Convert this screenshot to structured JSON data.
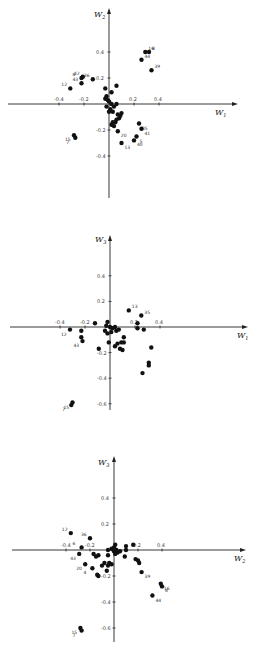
{
  "chart_data": [
    {
      "type": "scatter",
      "title": "",
      "xlabel": "W1",
      "ylabel": "W2",
      "xlim": [
        -0.6,
        0.7
      ],
      "ylim": [
        -0.7,
        0.6
      ],
      "xticks": [
        -0.4,
        -0.2,
        0.2,
        0.4
      ],
      "yticks": [
        0.4,
        0.2,
        -0.2,
        -0.4
      ],
      "grid": false,
      "points": [
        {
          "x": 0.29,
          "y": 0.4,
          "label": "16"
        },
        {
          "x": 0.32,
          "y": 0.4,
          "label": "8"
        },
        {
          "x": 0.26,
          "y": 0.34,
          "label": "44"
        },
        {
          "x": 0.34,
          "y": 0.26,
          "label": "39"
        },
        {
          "x": -0.21,
          "y": 0.21,
          "label": "42"
        },
        {
          "x": -0.22,
          "y": 0.2,
          "label": "6"
        },
        {
          "x": -0.22,
          "y": 0.16,
          "label": "43"
        },
        {
          "x": -0.13,
          "y": 0.19,
          "label": "36"
        },
        {
          "x": -0.31,
          "y": 0.12,
          "label": "12"
        },
        {
          "x": -0.28,
          "y": -0.24,
          "label": "15"
        },
        {
          "x": -0.27,
          "y": -0.26,
          "label": "7"
        },
        {
          "x": 0.24,
          "y": -0.15,
          "label": "35"
        },
        {
          "x": 0.26,
          "y": -0.19,
          "label": "41"
        },
        {
          "x": 0.22,
          "y": -0.25,
          "label": "5"
        },
        {
          "x": 0.2,
          "y": -0.28,
          "label": "40"
        },
        {
          "x": 0.1,
          "y": -0.3,
          "label": "13"
        },
        {
          "x": 0.07,
          "y": -0.21,
          "label": "20"
        },
        {
          "x": 0.06,
          "y": 0.14,
          "label": ""
        },
        {
          "x": 0.02,
          "y": 0.09,
          "label": ""
        },
        {
          "x": -0.03,
          "y": 0.12,
          "label": ""
        },
        {
          "x": -0.02,
          "y": 0.06,
          "label": ""
        },
        {
          "x": -0.03,
          "y": 0.04,
          "label": ""
        },
        {
          "x": -0.01,
          "y": 0.03,
          "label": ""
        },
        {
          "x": 0.0,
          "y": 0.02,
          "label": ""
        },
        {
          "x": 0.02,
          "y": 0.0,
          "label": ""
        },
        {
          "x": -0.02,
          "y": -0.02,
          "label": ""
        },
        {
          "x": 0.01,
          "y": -0.04,
          "label": ""
        },
        {
          "x": 0.04,
          "y": -0.02,
          "label": ""
        },
        {
          "x": 0.06,
          "y": 0.0,
          "label": ""
        },
        {
          "x": 0.03,
          "y": -0.06,
          "label": ""
        },
        {
          "x": 0.07,
          "y": -0.08,
          "label": ""
        },
        {
          "x": 0.09,
          "y": -0.09,
          "label": ""
        },
        {
          "x": 0.08,
          "y": -0.11,
          "label": ""
        },
        {
          "x": 0.06,
          "y": -0.12,
          "label": ""
        },
        {
          "x": 0.05,
          "y": -0.14,
          "label": ""
        },
        {
          "x": 0.03,
          "y": -0.14,
          "label": ""
        },
        {
          "x": 0.04,
          "y": -0.17,
          "label": ""
        },
        {
          "x": 0.02,
          "y": -0.16,
          "label": ""
        },
        {
          "x": 0.1,
          "y": -0.07,
          "label": ""
        },
        {
          "x": 0.0,
          "y": -0.06,
          "label": ""
        }
      ]
    },
    {
      "type": "scatter",
      "title": "",
      "xlabel": "W1",
      "ylabel": "W3",
      "xlim": [
        -0.6,
        0.7
      ],
      "ylim": [
        -0.7,
        0.6
      ],
      "xticks": [
        -0.4,
        -0.2,
        0.2,
        0.4
      ],
      "yticks": [
        0.4,
        0.2,
        -0.2,
        -0.4,
        -0.6
      ],
      "grid": false,
      "points": [
        {
          "x": 0.15,
          "y": 0.13,
          "label": "13"
        },
        {
          "x": 0.25,
          "y": 0.09,
          "label": "35"
        },
        {
          "x": -0.32,
          "y": -0.02,
          "label": "12"
        },
        {
          "x": -0.22,
          "y": -0.11,
          "label": "43"
        },
        {
          "x": -0.3,
          "y": -0.59,
          "label": "15"
        },
        {
          "x": -0.31,
          "y": -0.61,
          "label": "7"
        },
        {
          "x": -0.23,
          "y": -0.03,
          "label": ""
        },
        {
          "x": -0.23,
          "y": -0.08,
          "label": ""
        },
        {
          "x": -0.12,
          "y": 0.03,
          "label": ""
        },
        {
          "x": -0.09,
          "y": -0.17,
          "label": ""
        },
        {
          "x": 0.22,
          "y": 0.03,
          "label": ""
        },
        {
          "x": 0.22,
          "y": -0.01,
          "label": ""
        },
        {
          "x": 0.27,
          "y": -0.02,
          "label": ""
        },
        {
          "x": 0.33,
          "y": -0.16,
          "label": ""
        },
        {
          "x": 0.31,
          "y": -0.28,
          "label": ""
        },
        {
          "x": 0.31,
          "y": -0.3,
          "label": ""
        },
        {
          "x": 0.26,
          "y": -0.36,
          "label": ""
        },
        {
          "x": -0.02,
          "y": 0.04,
          "label": ""
        },
        {
          "x": -0.03,
          "y": 0.01,
          "label": ""
        },
        {
          "x": 0.0,
          "y": 0.0,
          "label": ""
        },
        {
          "x": 0.02,
          "y": -0.01,
          "label": ""
        },
        {
          "x": 0.04,
          "y": 0.0,
          "label": ""
        },
        {
          "x": 0.05,
          "y": -0.03,
          "label": ""
        },
        {
          "x": 0.07,
          "y": -0.02,
          "label": ""
        },
        {
          "x": 0.01,
          "y": -0.04,
          "label": ""
        },
        {
          "x": -0.02,
          "y": -0.05,
          "label": ""
        },
        {
          "x": -0.04,
          "y": -0.03,
          "label": ""
        },
        {
          "x": -0.01,
          "y": -0.12,
          "label": ""
        },
        {
          "x": 0.04,
          "y": -0.15,
          "label": ""
        },
        {
          "x": 0.06,
          "y": -0.13,
          "label": ""
        },
        {
          "x": 0.08,
          "y": -0.17,
          "label": ""
        },
        {
          "x": 0.1,
          "y": -0.18,
          "label": ""
        },
        {
          "x": 0.09,
          "y": -0.12,
          "label": ""
        },
        {
          "x": 0.11,
          "y": -0.08,
          "label": ""
        },
        {
          "x": 0.11,
          "y": -0.12,
          "label": ""
        }
      ]
    },
    {
      "type": "scatter",
      "title": "",
      "xlabel": "W2",
      "ylabel": "W3",
      "xlim": [
        -0.6,
        0.7
      ],
      "ylim": [
        -0.7,
        0.6
      ],
      "xticks": [
        -0.4,
        -0.2,
        0.2,
        0.4
      ],
      "yticks": [
        0.4,
        0.2,
        -0.2,
        -0.4,
        -0.6
      ],
      "grid": false,
      "points": [
        {
          "x": -0.36,
          "y": 0.13,
          "label": "12"
        },
        {
          "x": -0.2,
          "y": 0.09,
          "label": "36"
        },
        {
          "x": -0.27,
          "y": 0.02,
          "label": "6"
        },
        {
          "x": -0.29,
          "y": -0.03,
          "label": "43"
        },
        {
          "x": -0.24,
          "y": -0.11,
          "label": "20"
        },
        {
          "x": -0.18,
          "y": -0.14,
          "label": "4"
        },
        {
          "x": 0.23,
          "y": -0.17,
          "label": "39"
        },
        {
          "x": 0.39,
          "y": -0.26,
          "label": "16"
        },
        {
          "x": 0.4,
          "y": -0.28,
          "label": "8"
        },
        {
          "x": 0.32,
          "y": -0.35,
          "label": "44"
        },
        {
          "x": -0.28,
          "y": -0.6,
          "label": "15"
        },
        {
          "x": -0.27,
          "y": -0.62,
          "label": "7"
        },
        {
          "x": -0.17,
          "y": -0.03,
          "label": ""
        },
        {
          "x": -0.15,
          "y": -0.05,
          "label": ""
        },
        {
          "x": -0.13,
          "y": -0.04,
          "label": ""
        },
        {
          "x": -0.14,
          "y": -0.19,
          "label": ""
        },
        {
          "x": -0.13,
          "y": -0.2,
          "label": ""
        },
        {
          "x": -0.1,
          "y": -0.12,
          "label": ""
        },
        {
          "x": -0.08,
          "y": -0.1,
          "label": ""
        },
        {
          "x": -0.05,
          "y": -0.04,
          "label": ""
        },
        {
          "x": -0.05,
          "y": -0.12,
          "label": ""
        },
        {
          "x": -0.04,
          "y": -0.1,
          "label": ""
        },
        {
          "x": -0.02,
          "y": -0.11,
          "label": ""
        },
        {
          "x": -0.06,
          "y": -0.16,
          "label": ""
        },
        {
          "x": -0.05,
          "y": 0.0,
          "label": ""
        },
        {
          "x": -0.02,
          "y": 0.01,
          "label": ""
        },
        {
          "x": 0.0,
          "y": 0.02,
          "label": ""
        },
        {
          "x": 0.01,
          "y": 0.04,
          "label": ""
        },
        {
          "x": 0.02,
          "y": 0.0,
          "label": ""
        },
        {
          "x": 0.0,
          "y": -0.01,
          "label": ""
        },
        {
          "x": 0.01,
          "y": -0.03,
          "label": ""
        },
        {
          "x": 0.03,
          "y": -0.02,
          "label": ""
        },
        {
          "x": 0.05,
          "y": -0.01,
          "label": ""
        },
        {
          "x": 0.1,
          "y": 0.03,
          "label": ""
        },
        {
          "x": 0.1,
          "y": 0.0,
          "label": ""
        },
        {
          "x": 0.09,
          "y": -0.05,
          "label": ""
        },
        {
          "x": 0.16,
          "y": 0.04,
          "label": ""
        },
        {
          "x": 0.18,
          "y": -0.07,
          "label": ""
        },
        {
          "x": 0.2,
          "y": -0.08,
          "label": ""
        },
        {
          "x": 0.21,
          "y": -0.1,
          "label": ""
        }
      ]
    }
  ],
  "panels": [
    {
      "x_label_main": "W",
      "x_label_sub": "1",
      "y_label_main": "W",
      "y_label_sub": "2",
      "tick_labels": {
        "x": [
          "-0.4",
          "-0.2",
          "0.2",
          "0.4"
        ],
        "y": [
          "0.4",
          "0.2",
          "-0.2",
          "-0.4"
        ]
      }
    },
    {
      "x_label_main": "W",
      "x_label_sub": "1",
      "y_label_main": "W",
      "y_label_sub": "3",
      "tick_labels": {
        "x": [
          "-0.4",
          "-0.2",
          "0.2",
          "0.4"
        ],
        "y": [
          "0.4",
          "0.2",
          "-0.2",
          "-0.4",
          "-0.6"
        ]
      }
    },
    {
      "x_label_main": "W",
      "x_label_sub": "2",
      "y_label_main": "W",
      "y_label_sub": "3",
      "tick_labels": {
        "x": [
          "-0.4",
          "-0.2",
          "0.2",
          "0.4"
        ],
        "y": [
          "0.4",
          "0.2",
          "-0.2",
          "-0.4",
          "-0.6"
        ]
      }
    }
  ]
}
